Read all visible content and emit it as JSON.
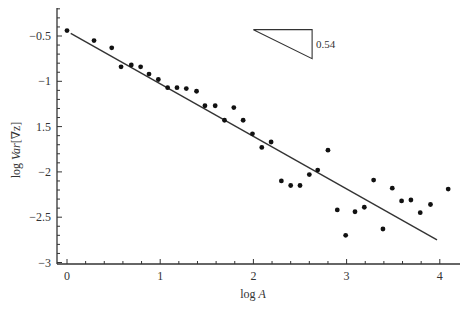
{
  "chart_data": {
    "type": "scatter",
    "title": "",
    "xlabel": "log A",
    "xlabel_parts": {
      "prefix": "log",
      "var": "A"
    },
    "ylabel": "log Var[∇z]",
    "ylabel_parts": {
      "prefix": "log",
      "var": "Var",
      "arg": "[∇z]"
    },
    "xlim": [
      -0.1,
      4.2
    ],
    "ylim": [
      -3.02,
      -0.2
    ],
    "xticks": [
      0,
      1,
      2,
      3,
      4
    ],
    "xtick_labels": [
      "0",
      "1",
      "2",
      "3",
      "4"
    ],
    "x_minor_step": 0.2,
    "yticks": [
      -0.5,
      -1,
      -1.5,
      -2,
      -2.5,
      -3
    ],
    "ytick_labels": [
      "-0.5",
      "-1",
      "1.5",
      "-2",
      "-2.5",
      "-3"
    ],
    "y_minor_step": 0.1,
    "grid": false,
    "legend": null,
    "series": [
      {
        "name": "data",
        "kind": "points",
        "x": [
          0.0,
          0.29,
          0.48,
          0.58,
          0.69,
          0.79,
          0.88,
          0.98,
          1.08,
          1.18,
          1.28,
          1.39,
          1.48,
          1.59,
          1.69,
          1.79,
          1.89,
          1.99,
          2.09,
          2.19,
          2.3,
          2.4,
          2.5,
          2.6,
          2.69,
          2.8,
          2.9,
          2.99,
          3.09,
          3.19,
          3.29,
          3.39,
          3.49,
          3.59,
          3.69,
          3.79,
          3.9,
          4.09
        ],
        "y": [
          -0.44,
          -0.55,
          -0.63,
          -0.84,
          -0.82,
          -0.84,
          -0.92,
          -0.98,
          -1.07,
          -1.07,
          -1.08,
          -1.11,
          -1.27,
          -1.27,
          -1.43,
          -1.29,
          -1.43,
          -1.58,
          -1.73,
          -1.67,
          -2.1,
          -2.15,
          -2.15,
          -2.03,
          -1.98,
          -1.76,
          -2.42,
          -2.7,
          -2.44,
          -2.39,
          -2.09,
          -2.63,
          -2.18,
          -2.32,
          -2.31,
          -2.45,
          -2.36,
          -2.19
        ]
      },
      {
        "name": "fit",
        "kind": "line",
        "x": [
          0.04,
          3.97
        ],
        "y": [
          -0.47,
          -2.75
        ],
        "slope": -0.54
      }
    ],
    "annotations": [
      {
        "type": "slope-triangle",
        "x0": 2.0,
        "x1": 2.63,
        "y_top": -0.43,
        "y_bottom": -0.75,
        "label": "0.54"
      }
    ]
  }
}
